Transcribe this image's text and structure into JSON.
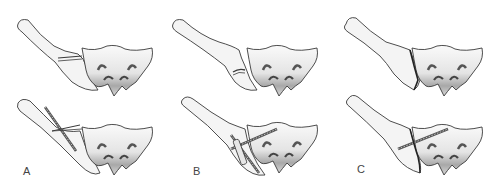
{
  "figure": {
    "type": "medical-illustration",
    "columns": [
      {
        "label": "A",
        "top": "fracture through posterior ilium (crescent) — unfixed",
        "bottom": "fixation with crossed screws/pins through iliac fragment"
      },
      {
        "label": "B",
        "top": "transverse fracture of ilium near sacroiliac joint — unfixed",
        "bottom": "fixation with crossed lag screws and plate"
      },
      {
        "label": "C",
        "top": "sacroiliac joint disruption — unfixed",
        "bottom": "fixation with single iliosacral screw"
      }
    ],
    "colors": {
      "outline": "#3a3a3a",
      "bone_fill": "#f4f4f4",
      "shade_dark": "#6e6e6e",
      "screw": "#555555",
      "label": "#444444"
    }
  }
}
